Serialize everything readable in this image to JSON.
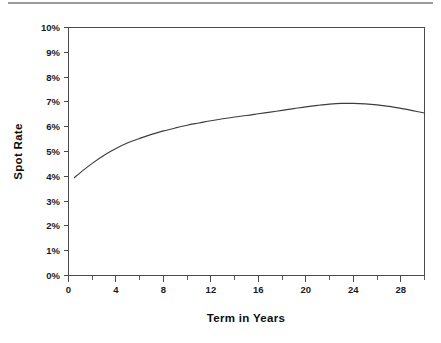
{
  "figure": {
    "name": "spot-rate-yield-curve",
    "top_rule_color": "#9a9a9a",
    "line_color": "#3d3d3d",
    "axis_color": "#4a4a4a",
    "background": "#ffffff"
  },
  "chart_data": {
    "type": "line",
    "title": "",
    "xlabel": "Term in Years",
    "ylabel": "Spot Rate",
    "xlim": [
      0,
      30
    ],
    "ylim": [
      0,
      10
    ],
    "grid": false,
    "legend": null,
    "x_tick_labels": [
      "0",
      "4",
      "8",
      "12",
      "16",
      "20",
      "24",
      "28"
    ],
    "x_tick_values": [
      0,
      4,
      8,
      12,
      16,
      20,
      24,
      28
    ],
    "x_minor_tick_values": [
      2,
      6,
      10,
      14,
      18,
      22,
      26,
      30
    ],
    "y_tick_labels": [
      "0%",
      "1%",
      "2%",
      "3%",
      "4%",
      "5%",
      "6%",
      "7%",
      "8%",
      "9%",
      "10%"
    ],
    "y_tick_values": [
      0,
      1,
      2,
      3,
      4,
      5,
      6,
      7,
      8,
      9,
      10
    ],
    "series": [
      {
        "name": "Spot Rate",
        "x": [
          0.5,
          1,
          2,
          3,
          4,
          5,
          6,
          7,
          8,
          9,
          10,
          11,
          12,
          13,
          14,
          15,
          16,
          17,
          18,
          19,
          20,
          21,
          22,
          23,
          24,
          25,
          26,
          27,
          28,
          29,
          30
        ],
        "values": [
          3.95,
          4.15,
          4.52,
          4.85,
          5.12,
          5.35,
          5.53,
          5.69,
          5.83,
          5.95,
          6.06,
          6.15,
          6.24,
          6.32,
          6.39,
          6.45,
          6.52,
          6.59,
          6.66,
          6.73,
          6.8,
          6.86,
          6.91,
          6.94,
          6.94,
          6.92,
          6.88,
          6.82,
          6.74,
          6.65,
          6.55
        ]
      }
    ]
  }
}
